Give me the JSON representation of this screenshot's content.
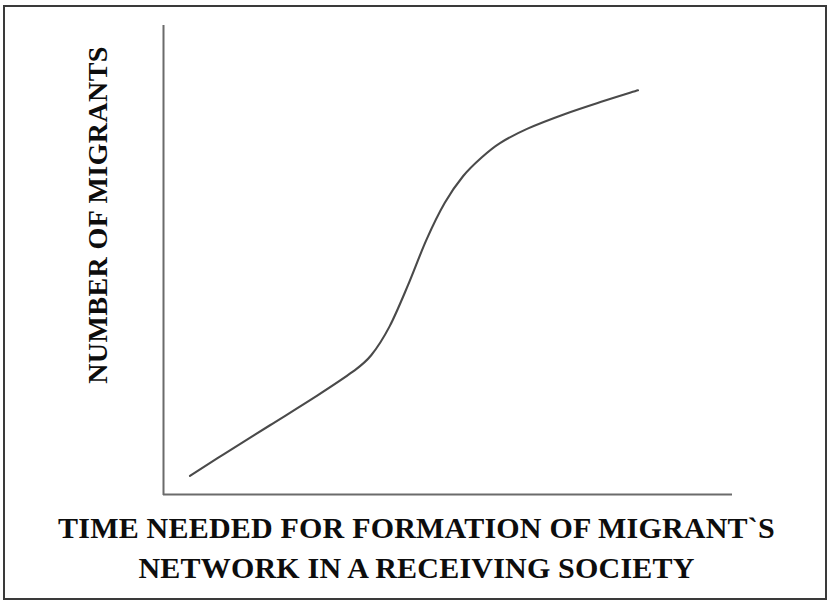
{
  "figure": {
    "background_color": "#ffffff",
    "border_color": "#3a3a3a",
    "axis_color": "#6b6b6b",
    "curve_color": "#4a4a4a",
    "text_color": "#0d0d0d"
  },
  "axes": {
    "y_title": "NUMBER OF MIGRANTS",
    "x_title_line1": "TIME NEEDED FOR FORMATION OF MIGRANT`S",
    "x_title_line2": "NETWORK IN A RECEIVING SOCIETY"
  },
  "chart_data": {
    "type": "line",
    "title": "",
    "subtitle": "",
    "xlabel": "TIME NEEDED FOR FORMATION OF MIGRANT`S NETWORK IN A RECEIVING SOCIETY",
    "ylabel": "NUMBER OF MIGRANTS",
    "shape": "sigmoid / S-curve (logistic growth)",
    "grid": false,
    "legend": null,
    "axis_ticks": false,
    "tick_labels": [],
    "xlim": [
      0,
      100
    ],
    "ylim": [
      0,
      100
    ],
    "series": [
      {
        "name": "Number of migrants over time",
        "x": [
          2.6,
          10,
          20,
          30,
          38,
          42,
          46,
          50,
          54,
          58,
          62,
          66,
          70,
          76,
          84,
          92,
          100
        ],
        "y": [
          2.2,
          7.5,
          14.5,
          21.5,
          27.5,
          31.5,
          38.5,
          48.5,
          59.5,
          68.5,
          75.0,
          79.5,
          83.0,
          86.5,
          90.0,
          93.0,
          95.8
        ]
      }
    ],
    "annotations": [
      {
        "label": "slow initial growth",
        "x_range": [
          2.6,
          38
        ]
      },
      {
        "label": "rapid take-off (inflection)",
        "x_range": [
          38,
          62
        ]
      },
      {
        "label": "saturation / slowing growth",
        "x_range": [
          62,
          100
        ]
      }
    ]
  }
}
